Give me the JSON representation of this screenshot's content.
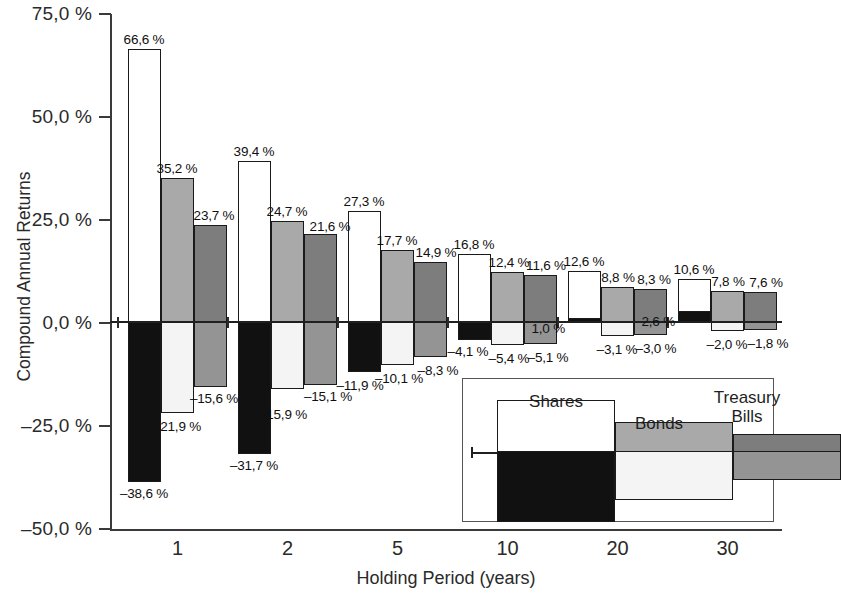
{
  "chart_data": {
    "type": "bar",
    "title": "",
    "xlabel": "Holding Period (years)",
    "ylabel": "Compound Annual Returns",
    "categories": [
      "1",
      "2",
      "5",
      "10",
      "20",
      "30"
    ],
    "ylim": [
      -50.0,
      75.0
    ],
    "y_ticks": [
      "75,0 %",
      "50,0 %",
      "25,0 %",
      "0,0 %",
      "-25,0 %",
      "-50,0 %"
    ],
    "y_tick_values": [
      75.0,
      50.0,
      25.0,
      0.0,
      -25.0,
      -50.0
    ],
    "grid": false,
    "legend_position": "inside-bottom-right",
    "note": "Each bar spans the best (top) to worst (bottom) compound annual return over the holding period.",
    "series": [
      {
        "name": "Shares",
        "max_values": [
          66.6,
          39.4,
          27.3,
          16.8,
          12.6,
          10.6
        ],
        "min_values": [
          -38.6,
          -31.7,
          -11.9,
          -4.1,
          1.0,
          2.6
        ],
        "max_labels": [
          "66,6 %",
          "39,4 %",
          "27,3 %",
          "16,8 %",
          "12,6 %",
          "10,6 %"
        ],
        "min_labels": [
          "-38,6 %",
          "-31,7 %",
          "-11,9 %",
          "-4,1 %",
          "1,0 %",
          "2,6 %"
        ],
        "color_positive": "#ffffff",
        "color_negative": "#111111"
      },
      {
        "name": "Bonds",
        "max_values": [
          35.2,
          24.7,
          17.7,
          12.4,
          8.8,
          7.8
        ],
        "min_values": [
          -21.9,
          -15.9,
          -10.1,
          -5.4,
          -3.1,
          -2.0
        ],
        "max_labels": [
          "35,2 %",
          "24,7 %",
          "17,7 %",
          "12,4 %",
          "8,8 %",
          "7,8 %"
        ],
        "min_labels": [
          "-21,9 %",
          "-15,9 %",
          "-10,1 %",
          "-5,4 %",
          "-3,1 %",
          "-2,0 %"
        ],
        "color_positive": "#a9a9a9",
        "color_negative": "#f4f4f4"
      },
      {
        "name": "Treasury Bills",
        "max_values": [
          23.7,
          21.6,
          14.9,
          11.6,
          8.3,
          7.6
        ],
        "min_values": [
          -15.6,
          -15.1,
          -8.3,
          -5.1,
          -3.0,
          -1.8
        ],
        "max_labels": [
          "23,7 %",
          "21,6 %",
          "14,9 %",
          "11,6 %",
          "8,3 %",
          "7,6 %"
        ],
        "min_labels": [
          "-15,6 %",
          "-15,1 %",
          "-8,3 %",
          "-5,1 %",
          "-3,0 %",
          "-1,8 %"
        ],
        "color_positive": "#7d7d7d",
        "color_negative": "#949494"
      }
    ]
  },
  "legend": {
    "items": [
      {
        "label": "Shares",
        "label_line2": ""
      },
      {
        "label": "Bonds",
        "label_line2": ""
      },
      {
        "label": "Treasury",
        "label_line2": "Bills"
      }
    ]
  }
}
